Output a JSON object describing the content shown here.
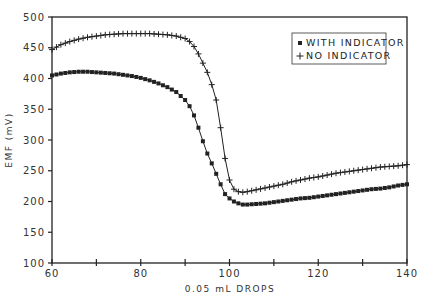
{
  "chart_data": {
    "type": "line",
    "title": "",
    "xlabel": "0.05 mL DROPS",
    "ylabel": "EMF (mV)",
    "xlim": [
      60,
      140
    ],
    "ylim": [
      100,
      500
    ],
    "x_ticks": [
      60,
      70,
      80,
      90,
      100,
      110,
      120,
      130,
      140
    ],
    "x_tick_labels": [
      "60",
      "",
      "80",
      "",
      "100",
      "",
      "120",
      "",
      "140"
    ],
    "y_ticks": [
      100,
      150,
      200,
      250,
      300,
      350,
      400,
      450,
      500
    ],
    "y_tick_labels": [
      "100",
      "150",
      "200",
      "250",
      "300",
      "350",
      "400",
      "450",
      "500"
    ],
    "grid": false,
    "legend_position": "upper right",
    "series": [
      {
        "name": "WITH INDICATOR",
        "marker": "square",
        "x": [
          60,
          62,
          64,
          66,
          68,
          70,
          72,
          74,
          76,
          78,
          80,
          82,
          84,
          86,
          88,
          90,
          91,
          92,
          93,
          94,
          95,
          96,
          97,
          98,
          99,
          100,
          101,
          102,
          103,
          104,
          106,
          108,
          110,
          112,
          114,
          116,
          118,
          120,
          122,
          124,
          126,
          128,
          130,
          132,
          134,
          136,
          138,
          140
        ],
        "values": [
          405,
          408,
          410,
          411,
          411,
          410,
          409,
          408,
          406,
          404,
          401,
          397,
          392,
          386,
          378,
          365,
          355,
          340,
          320,
          298,
          278,
          262,
          245,
          228,
          212,
          205,
          200,
          197,
          195,
          195,
          196,
          197,
          199,
          201,
          203,
          205,
          206,
          208,
          210,
          212,
          214,
          216,
          218,
          220,
          221,
          223,
          226,
          228
        ]
      },
      {
        "name": "NO INDICATOR",
        "marker": "plus",
        "x": [
          60,
          62,
          64,
          66,
          68,
          70,
          72,
          74,
          76,
          78,
          80,
          82,
          84,
          86,
          88,
          90,
          91,
          92,
          93,
          94,
          95,
          96,
          97,
          98,
          99,
          100,
          101,
          102,
          103,
          104,
          106,
          108,
          110,
          112,
          114,
          116,
          118,
          120,
          122,
          124,
          126,
          128,
          130,
          132,
          134,
          136,
          138,
          140
        ],
        "values": [
          447,
          455,
          460,
          464,
          467,
          469,
          471,
          472,
          473,
          473,
          473,
          473,
          472,
          471,
          469,
          465,
          460,
          452,
          440,
          425,
          410,
          390,
          365,
          320,
          270,
          235,
          220,
          216,
          215,
          216,
          219,
          222,
          225,
          228,
          232,
          235,
          238,
          240,
          243,
          246,
          248,
          250,
          252,
          254,
          256,
          257,
          258,
          260
        ]
      }
    ]
  }
}
